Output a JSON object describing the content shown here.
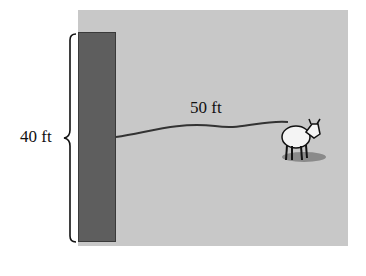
{
  "diagram": {
    "wall_height_label": "40 ft",
    "rope_length_label": "50 ft",
    "colors": {
      "field": "#c8c8c8",
      "wall": "#5e5e5e",
      "rope": "#333333",
      "background": "#ffffff"
    }
  }
}
